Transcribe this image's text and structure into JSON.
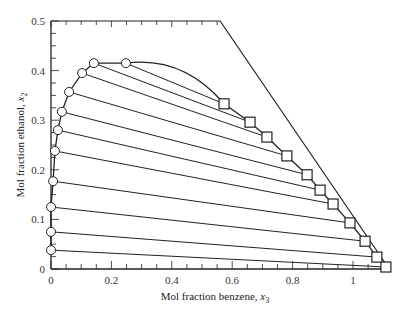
{
  "chart_data": {
    "type": "scatter",
    "title": "",
    "xlabel": "Mol fraction benzene, x3",
    "ylabel": "Mol fraction ethanol, x2",
    "xlabel_main": "Mol fraction benzene, ",
    "xlabel_var": "x",
    "xlabel_sub": "3",
    "ylabel_main": "Mol fraction ethanol, ",
    "ylabel_var": "x",
    "ylabel_sub": "2",
    "xlim": [
      0,
      1.12
    ],
    "ylim": [
      0,
      0.5
    ],
    "xticks": [
      0,
      0.2,
      0.4,
      0.6,
      0.8,
      1
    ],
    "xtick_labels": [
      "0",
      "0.2",
      "0.4",
      "0.6",
      "0.8",
      "1"
    ],
    "yticks": [
      0,
      0.1,
      0.2,
      0.3,
      0.4,
      0.5
    ],
    "ytick_labels": [
      "0",
      "0.1",
      "0.2",
      "0.3",
      "0.4",
      "0.5"
    ],
    "grid": false,
    "legend": null,
    "boundary": [
      [
        0,
        0.5
      ],
      [
        0.56,
        0.5
      ],
      [
        1.12,
        0
      ]
    ],
    "series": [
      {
        "name": "Water-rich phase (circles)",
        "marker": "circle",
        "points": [
          [
            0.0,
            0.038
          ],
          [
            0.0,
            0.075
          ],
          [
            0.0,
            0.125
          ],
          [
            0.007,
            0.177
          ],
          [
            0.013,
            0.238
          ],
          [
            0.023,
            0.28
          ],
          [
            0.036,
            0.317
          ],
          [
            0.06,
            0.357
          ],
          [
            0.103,
            0.395
          ],
          [
            0.142,
            0.415
          ],
          [
            0.248,
            0.415
          ]
        ]
      },
      {
        "name": "Benzene-rich phase (squares)",
        "marker": "square",
        "points": [
          [
            1.109,
            0.004
          ],
          [
            1.079,
            0.024
          ],
          [
            1.04,
            0.056
          ],
          [
            0.99,
            0.093
          ],
          [
            0.934,
            0.131
          ],
          [
            0.891,
            0.159
          ],
          [
            0.848,
            0.19
          ],
          [
            0.781,
            0.228
          ],
          [
            0.715,
            0.266
          ],
          [
            0.659,
            0.296
          ],
          [
            0.573,
            0.333
          ]
        ]
      }
    ],
    "tie_lines": [
      [
        [
          0.0,
          0.038
        ],
        [
          1.109,
          0.004
        ]
      ],
      [
        [
          0.0,
          0.075
        ],
        [
          1.079,
          0.024
        ]
      ],
      [
        [
          0.0,
          0.125
        ],
        [
          1.04,
          0.056
        ]
      ],
      [
        [
          0.007,
          0.177
        ],
        [
          0.99,
          0.093
        ]
      ],
      [
        [
          0.013,
          0.238
        ],
        [
          0.934,
          0.131
        ]
      ],
      [
        [
          0.023,
          0.28
        ],
        [
          0.891,
          0.159
        ]
      ],
      [
        [
          0.036,
          0.317
        ],
        [
          0.848,
          0.19
        ]
      ],
      [
        [
          0.06,
          0.357
        ],
        [
          0.781,
          0.228
        ]
      ],
      [
        [
          0.103,
          0.395
        ],
        [
          0.715,
          0.266
        ]
      ],
      [
        [
          0.142,
          0.415
        ],
        [
          0.659,
          0.296
        ]
      ],
      [
        [
          0.248,
          0.415
        ],
        [
          0.573,
          0.333
        ]
      ]
    ],
    "colors": {
      "line": "#222222",
      "marker_fill": "#ffffff",
      "text": "#333333"
    }
  }
}
